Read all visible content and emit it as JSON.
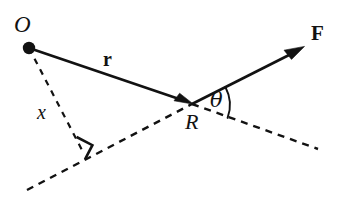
{
  "figure": {
    "background_color": "#ffffff",
    "stroke_color": "#121212",
    "canvas": {
      "width": 342,
      "height": 198
    }
  },
  "labels": {
    "origin": "O",
    "application_point": "R",
    "moment_arm": "x",
    "position_vector": "r",
    "force_vector": "F",
    "angle": "θ"
  },
  "points": {
    "O": {
      "x": 29,
      "y": 48,
      "name": "origin-point",
      "marker": "filled-dot",
      "radius": 6
    },
    "R": {
      "x": 192,
      "y": 104,
      "name": "force-application-point"
    },
    "perpendicular_foot": {
      "x": 83,
      "y": 152,
      "name": "perpendicular-foot"
    },
    "F_tip": {
      "x": 303,
      "y": 47,
      "name": "force-arrow-tip"
    },
    "line_of_action_start": {
      "x": 27,
      "y": 190
    },
    "line_of_action_end": {
      "x": 318,
      "y": 149
    }
  },
  "segments": [
    {
      "id": "r-vector",
      "name": "position-vector-r",
      "style": "solid",
      "arrow": "end",
      "from": "O",
      "to": "R"
    },
    {
      "id": "F-vector",
      "name": "force-vector-F",
      "style": "solid",
      "arrow": "end",
      "from": "R",
      "to": "F_tip"
    },
    {
      "id": "x-line",
      "name": "moment-arm-x-line",
      "style": "dashed",
      "arrow": "none",
      "from": "O",
      "to": "perpendicular_foot"
    },
    {
      "id": "action-line",
      "name": "line-of-action-dashed",
      "style": "dashed",
      "arrow": "none",
      "from": "line_of_action_start",
      "to": "R"
    },
    {
      "id": "action-line-ext",
      "name": "line-of-action-extension-dashed",
      "style": "dashed",
      "arrow": "none",
      "from": "R",
      "to": "line_of_action_end"
    }
  ],
  "markers": {
    "right_angle": {
      "name": "right-angle-marker",
      "at": "perpendicular_foot",
      "size": 15
    },
    "angle_arc": {
      "name": "angle-arc",
      "at": "R",
      "radius": 38,
      "between": [
        "F-vector",
        "line-of-action-extension-dashed"
      ]
    }
  }
}
